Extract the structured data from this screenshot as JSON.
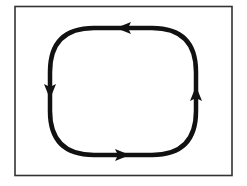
{
  "diagram": {
    "type": "cycle-loop",
    "frame": {
      "x": 15,
      "y": 6,
      "width": 217,
      "height": 169,
      "stroke": "#333333"
    },
    "loop": {
      "left": 50,
      "right": 196,
      "top": 28,
      "bottom": 155,
      "radius": 44,
      "stroke": "#111111",
      "stroke_width": 4.5,
      "direction": "counterclockwise"
    },
    "arrows": [
      {
        "position": "top",
        "direction": "left",
        "x": 125,
        "y": 28
      },
      {
        "position": "left",
        "direction": "down",
        "x": 50,
        "y": 90
      },
      {
        "position": "bottom",
        "direction": "right",
        "x": 121,
        "y": 155
      },
      {
        "position": "right",
        "direction": "up",
        "x": 196,
        "y": 95
      }
    ]
  }
}
